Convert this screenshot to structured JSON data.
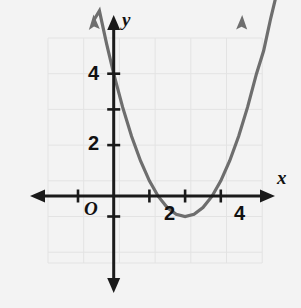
{
  "figure": {
    "background_color": "#f3f3f3",
    "width": 301,
    "height": 308
  },
  "labels": {
    "x_axis": "x",
    "y_axis": "y",
    "origin": "O"
  },
  "chart_data": {
    "type": "line",
    "title": "",
    "subtitle": "",
    "xlabel": "x",
    "ylabel": "y",
    "xlim": [
      -1.857,
      4.257
    ],
    "ylim": [
      -1.914,
      4.514
    ],
    "grid": true,
    "grid_color": "#e2e2e2",
    "grid_step": 1,
    "legend": "none",
    "axis_color": "#1a1a1a",
    "curve_color": "#6e6e6e",
    "x_ticks_labeled": [
      2,
      4
    ],
    "y_ticks_labeled": [
      2,
      4
    ],
    "x_tick_labels": [
      "2",
      "4"
    ],
    "y_tick_labels": [
      "2",
      "4"
    ],
    "minor_tick_step": 0.5,
    "origin_label": "O",
    "series": [
      {
        "name": "parabola",
        "equation": "y = x^2 - 4x + 3",
        "roots": [
          1,
          3
        ],
        "vertex": [
          2,
          -1
        ],
        "y_intercept": 3,
        "arrow_start": true,
        "arrow_end": true,
        "x": [
          -0.55,
          -0.4,
          -0.2,
          0,
          0.25,
          0.5,
          0.75,
          1,
          1.25,
          1.5,
          1.75,
          2,
          2.25,
          2.5,
          2.75,
          3,
          3.25,
          3.5,
          3.75,
          4,
          4.2,
          4.4,
          4.55
        ],
        "y": [
          4.51,
          4.76,
          3.84,
          3,
          2.0625,
          1.25,
          0.5625,
          0,
          -0.4375,
          -0.75,
          -0.9375,
          -1,
          -0.9375,
          -0.75,
          -0.4375,
          0,
          0.5625,
          1.25,
          2.0625,
          3,
          3.64,
          4.56,
          5.18
        ]
      }
    ]
  }
}
